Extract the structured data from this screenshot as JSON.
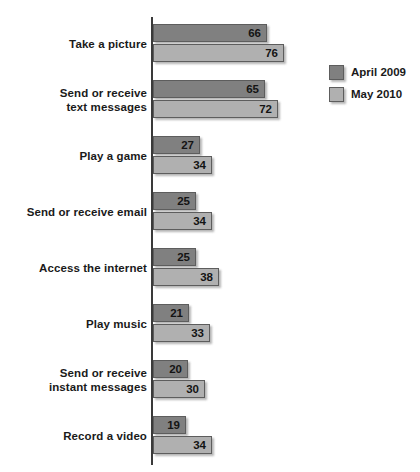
{
  "chart_data": {
    "type": "bar",
    "orientation": "horizontal",
    "title": "",
    "xlabel": "",
    "ylabel": "",
    "xlim": [
      0,
      80
    ],
    "grid": false,
    "legend_position": "right",
    "categories": [
      "Take a picture",
      "Send or receive\ntext messages",
      "Play a game",
      "Send or receive email",
      "Access the internet",
      "Play music",
      "Send or receive\ninstant messages",
      "Record a video"
    ],
    "series": [
      {
        "name": "April 2009",
        "color": "#808080",
        "values": [
          66,
          65,
          27,
          25,
          25,
          21,
          20,
          19
        ]
      },
      {
        "name": "May 2010",
        "color": "#b0b0b0",
        "values": [
          76,
          72,
          34,
          34,
          38,
          33,
          30,
          34
        ]
      }
    ]
  },
  "legend": {
    "items": [
      {
        "label": "April 2009",
        "color": "#808080"
      },
      {
        "label": "May 2010",
        "color": "#b0b0b0"
      }
    ]
  },
  "axis": {
    "color": "#3a3a3a"
  }
}
